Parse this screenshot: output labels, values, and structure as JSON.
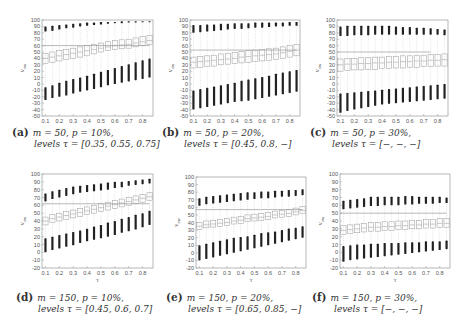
{
  "figure": {
    "panels": [
      {
        "id": "a",
        "tag": "(a)",
        "line1": "m = 50, p = 10%,",
        "line2": "levels τ = [0.35, 0.55, 0.75]"
      },
      {
        "id": "b",
        "tag": "(b)",
        "line1": "m = 50, p = 20%,",
        "line2": "levels τ = [0.45, 0.8, −]"
      },
      {
        "id": "c",
        "tag": "(c)",
        "line1": "m = 50, p = 30%,",
        "line2": "levels τ = [−, −, −]"
      },
      {
        "id": "d",
        "tag": "(d)",
        "line1": "m = 150, p = 10%,",
        "line2": "levels τ = [0.45, 0.6, 0.7]"
      },
      {
        "id": "e",
        "tag": "(e)",
        "line1": "m = 150, p = 20%,",
        "line2": "levels τ = [0.65, 0.85, −]"
      },
      {
        "id": "f",
        "tag": "(f)",
        "line1": "m = 150, p = 30%,",
        "line2": "levels τ = [−, −, −]"
      }
    ]
  },
  "chart_data": [
    {
      "type": "box",
      "panel": "a",
      "title": "(a) m = 50, p = 10%, levels τ = [0.35, 0.55, 0.75]",
      "xlabel": "τ",
      "ylabel": "v_sw",
      "ylim": [
        -50,
        100
      ],
      "yticks": [
        -50,
        -40,
        -30,
        -20,
        -10,
        0,
        10,
        20,
        30,
        40,
        50,
        60,
        70,
        80,
        90,
        100
      ],
      "xticks": [
        0.1,
        0.2,
        0.3,
        0.4,
        0.5,
        0.6,
        0.7,
        0.8
      ],
      "x": [
        0.1,
        0.15,
        0.2,
        0.25,
        0.3,
        0.35,
        0.4,
        0.45,
        0.5,
        0.55,
        0.6,
        0.65,
        0.7,
        0.75,
        0.8,
        0.85
      ],
      "reference_line": {
        "y": 60,
        "x_end": 0.85
      },
      "median": [
        40,
        42,
        44,
        46,
        48,
        50,
        52,
        54,
        56,
        58,
        60,
        61,
        62,
        64,
        66,
        68
      ],
      "q1": [
        32,
        34,
        36,
        38,
        40,
        42,
        44,
        47,
        50,
        52,
        54,
        55,
        56,
        58,
        60,
        62
      ],
      "q3": [
        48,
        50,
        52,
        54,
        56,
        58,
        60,
        62,
        64,
        66,
        68,
        69,
        70,
        72,
        74,
        76
      ],
      "upper_cluster": [
        [
          82,
          90
        ],
        [
          83,
          91
        ],
        [
          85,
          92
        ],
        [
          87,
          93
        ],
        [
          88,
          94
        ],
        [
          90,
          95
        ],
        [
          91,
          96
        ],
        [
          92,
          96
        ],
        [
          93,
          97
        ],
        [
          94,
          97
        ],
        [
          95,
          97
        ],
        [
          95,
          98
        ],
        [
          96,
          98
        ],
        [
          96,
          98
        ],
        [
          97,
          98
        ],
        [
          97,
          98
        ]
      ],
      "lower_cluster": [
        [
          -25,
          -5
        ],
        [
          -22,
          -2
        ],
        [
          -20,
          2
        ],
        [
          -18,
          5
        ],
        [
          -15,
          8
        ],
        [
          -12,
          10
        ],
        [
          -10,
          13
        ],
        [
          -8,
          16
        ],
        [
          -5,
          19
        ],
        [
          -2,
          22
        ],
        [
          0,
          25
        ],
        [
          2,
          28
        ],
        [
          4,
          31
        ],
        [
          6,
          34
        ],
        [
          8,
          37
        ],
        [
          10,
          40
        ]
      ]
    },
    {
      "type": "box",
      "panel": "b",
      "title": "(b) m = 50, p = 20%, levels τ = [0.45, 0.8, −]",
      "xlabel": "τ",
      "ylabel": "v_sw",
      "ylim": [
        -50,
        100
      ],
      "yticks": [
        -50,
        -40,
        -30,
        -20,
        -10,
        0,
        10,
        20,
        30,
        40,
        50,
        60,
        70,
        80,
        90,
        100
      ],
      "xticks": [
        0.1,
        0.2,
        0.3,
        0.4,
        0.5,
        0.6,
        0.7,
        0.8
      ],
      "x": [
        0.1,
        0.15,
        0.2,
        0.25,
        0.3,
        0.35,
        0.4,
        0.45,
        0.5,
        0.55,
        0.6,
        0.65,
        0.7,
        0.75,
        0.8,
        0.85
      ],
      "reference_line": {
        "y": 53,
        "x_end": 0.85
      },
      "median": [
        34,
        35,
        36,
        37,
        38,
        39,
        40,
        42,
        43,
        44,
        45,
        46,
        47,
        49,
        51,
        53
      ],
      "q1": [
        25,
        26,
        27,
        28,
        30,
        31,
        32,
        33,
        34,
        35,
        36,
        37,
        38,
        40,
        42,
        44
      ],
      "q3": [
        42,
        43,
        44,
        45,
        47,
        48,
        49,
        51,
        52,
        53,
        54,
        55,
        56,
        58,
        60,
        62
      ],
      "upper_cluster": [
        [
          80,
          92
        ],
        [
          81,
          92
        ],
        [
          82,
          93
        ],
        [
          83,
          93
        ],
        [
          84,
          94
        ],
        [
          85,
          94
        ],
        [
          86,
          95
        ],
        [
          86,
          95
        ],
        [
          87,
          95
        ],
        [
          88,
          96
        ],
        [
          88,
          96
        ],
        [
          89,
          96
        ],
        [
          90,
          96
        ],
        [
          90,
          96
        ],
        [
          91,
          97
        ],
        [
          91,
          97
        ]
      ],
      "lower_cluster": [
        [
          -40,
          -10
        ],
        [
          -38,
          -8
        ],
        [
          -36,
          -6
        ],
        [
          -34,
          -4
        ],
        [
          -32,
          -2
        ],
        [
          -30,
          0
        ],
        [
          -28,
          2
        ],
        [
          -27,
          5
        ],
        [
          -26,
          7
        ],
        [
          -24,
          9
        ],
        [
          -22,
          11
        ],
        [
          -20,
          13
        ],
        [
          -18,
          16
        ],
        [
          -16,
          18
        ],
        [
          -14,
          20
        ],
        [
          -12,
          22
        ]
      ]
    },
    {
      "type": "box",
      "panel": "c",
      "title": "(c) m = 50, p = 30%, levels τ = [−, −, −]",
      "xlabel": "τ",
      "ylabel": "v_sw",
      "ylim": [
        -50,
        100
      ],
      "yticks": [
        -50,
        -40,
        -30,
        -20,
        -10,
        0,
        10,
        20,
        30,
        40,
        50,
        60,
        70,
        80,
        90,
        100
      ],
      "xticks": [
        0.1,
        0.2,
        0.3,
        0.4,
        0.5,
        0.6,
        0.7,
        0.8
      ],
      "x": [
        0.1,
        0.15,
        0.2,
        0.25,
        0.3,
        0.35,
        0.4,
        0.45,
        0.5,
        0.55,
        0.6,
        0.65,
        0.7,
        0.75,
        0.8,
        0.85
      ],
      "reference_line": {
        "y": 50,
        "x_end": 0.75
      },
      "median": [
        30,
        31,
        31,
        32,
        32,
        33,
        33,
        34,
        34,
        35,
        35,
        36,
        36,
        37,
        37,
        38
      ],
      "q1": [
        20,
        21,
        22,
        22,
        23,
        23,
        24,
        24,
        25,
        25,
        26,
        26,
        27,
        27,
        28,
        28
      ],
      "q3": [
        39,
        40,
        40,
        41,
        41,
        42,
        42,
        43,
        43,
        44,
        44,
        45,
        45,
        46,
        46,
        47
      ],
      "upper_cluster": [
        [
          75,
          90
        ],
        [
          75,
          91
        ],
        [
          76,
          91
        ],
        [
          76,
          91
        ],
        [
          76,
          91
        ],
        [
          77,
          91
        ],
        [
          77,
          91
        ],
        [
          77,
          91
        ],
        [
          77,
          90
        ],
        [
          77,
          89
        ],
        [
          77,
          89
        ],
        [
          77,
          88
        ],
        [
          77,
          88
        ],
        [
          77,
          87
        ],
        [
          77,
          86
        ],
        [
          76,
          85
        ]
      ],
      "lower_cluster": [
        [
          -45,
          -15
        ],
        [
          -42,
          -14
        ],
        [
          -40,
          -13
        ],
        [
          -38,
          -12
        ],
        [
          -36,
          -11
        ],
        [
          -34,
          -10
        ],
        [
          -32,
          -9
        ],
        [
          -31,
          -8
        ],
        [
          -30,
          -7
        ],
        [
          -29,
          -6
        ],
        [
          -28,
          -5
        ],
        [
          -27,
          -4
        ],
        [
          -26,
          -3
        ],
        [
          -25,
          -2
        ],
        [
          -24,
          -1
        ],
        [
          -23,
          0
        ]
      ]
    },
    {
      "type": "box",
      "panel": "d",
      "title": "(d) m = 150, p = 10%, levels τ = [0.45, 0.6, 0.7]",
      "xlabel": "τ",
      "ylabel": "v_sw",
      "ylim": [
        -20,
        100
      ],
      "yticks": [
        -20,
        -10,
        0,
        10,
        20,
        30,
        40,
        50,
        60,
        70,
        80,
        90,
        100
      ],
      "xticks": [
        0.1,
        0.2,
        0.3,
        0.4,
        0.5,
        0.6,
        0.7,
        0.8
      ],
      "x": [
        0.1,
        0.15,
        0.2,
        0.25,
        0.3,
        0.35,
        0.4,
        0.45,
        0.5,
        0.55,
        0.6,
        0.65,
        0.7,
        0.75,
        0.8,
        0.85
      ],
      "reference_line": {
        "y": 62,
        "x_end": 0.85
      },
      "median": [
        40,
        43,
        45,
        47,
        49,
        51,
        53,
        55,
        57,
        59,
        61,
        63,
        65,
        67,
        69,
        71
      ],
      "q1": [
        35,
        38,
        40,
        42,
        44,
        46,
        48,
        50,
        52,
        54,
        56,
        58,
        60,
        62,
        64,
        66
      ],
      "q3": [
        45,
        48,
        50,
        52,
        54,
        56,
        58,
        60,
        62,
        64,
        66,
        68,
        70,
        72,
        74,
        76
      ],
      "upper_cluster": [
        [
          65,
          75
        ],
        [
          68,
          78
        ],
        [
          70,
          80
        ],
        [
          72,
          82
        ],
        [
          74,
          84
        ],
        [
          76,
          85
        ],
        [
          77,
          86
        ],
        [
          78,
          87
        ],
        [
          79,
          88
        ],
        [
          80,
          89
        ],
        [
          82,
          90
        ],
        [
          83,
          90
        ],
        [
          85,
          91
        ],
        [
          86,
          92
        ],
        [
          87,
          93
        ],
        [
          88,
          94
        ]
      ],
      "lower_cluster": [
        [
          0,
          18
        ],
        [
          3,
          20
        ],
        [
          5,
          22
        ],
        [
          7,
          24
        ],
        [
          9,
          26
        ],
        [
          12,
          28
        ],
        [
          14,
          30
        ],
        [
          16,
          33
        ],
        [
          18,
          35
        ],
        [
          20,
          38
        ],
        [
          22,
          40
        ],
        [
          25,
          43
        ],
        [
          27,
          45
        ],
        [
          29,
          48
        ],
        [
          32,
          50
        ],
        [
          35,
          53
        ]
      ]
    },
    {
      "type": "box",
      "panel": "e",
      "title": "(e) m = 150, p = 20%, levels τ = [0.65, 0.85, −]",
      "xlabel": "τ",
      "ylabel": "v_sw",
      "ylim": [
        -20,
        100
      ],
      "yticks": [
        -20,
        -10,
        0,
        10,
        20,
        30,
        40,
        50,
        60,
        70,
        80,
        90,
        100
      ],
      "xticks": [
        0.1,
        0.2,
        0.3,
        0.4,
        0.5,
        0.6,
        0.7,
        0.8
      ],
      "x": [
        0.1,
        0.15,
        0.2,
        0.25,
        0.3,
        0.35,
        0.4,
        0.45,
        0.5,
        0.55,
        0.6,
        0.65,
        0.7,
        0.75,
        0.8,
        0.85
      ],
      "reference_line": {
        "y": 57,
        "x_end": 0.85
      },
      "median": [
        35,
        37,
        38,
        39,
        40,
        42,
        43,
        45,
        46,
        47,
        48,
        50,
        51,
        52,
        54,
        56
      ],
      "q1": [
        31,
        33,
        34,
        35,
        36,
        38,
        39,
        41,
        42,
        43,
        44,
        46,
        47,
        48,
        50,
        52
      ],
      "q3": [
        40,
        42,
        43,
        44,
        45,
        47,
        48,
        50,
        51,
        52,
        53,
        55,
        56,
        57,
        59,
        61
      ],
      "upper_cluster": [
        [
          62,
          72
        ],
        [
          64,
          74
        ],
        [
          65,
          75
        ],
        [
          66,
          76
        ],
        [
          67,
          77
        ],
        [
          68,
          78
        ],
        [
          69,
          79
        ],
        [
          70,
          80
        ],
        [
          71,
          80
        ],
        [
          72,
          81
        ],
        [
          72,
          81
        ],
        [
          73,
          82
        ],
        [
          74,
          82
        ],
        [
          74,
          83
        ],
        [
          75,
          83
        ],
        [
          76,
          84
        ]
      ],
      "lower_cluster": [
        [
          -10,
          10
        ],
        [
          -8,
          12
        ],
        [
          -6,
          14
        ],
        [
          -4,
          16
        ],
        [
          -2,
          18
        ],
        [
          0,
          20
        ],
        [
          2,
          21
        ],
        [
          4,
          22
        ],
        [
          6,
          24
        ],
        [
          8,
          26
        ],
        [
          10,
          27
        ],
        [
          12,
          28
        ],
        [
          14,
          30
        ],
        [
          16,
          32
        ],
        [
          18,
          33
        ],
        [
          20,
          35
        ]
      ]
    },
    {
      "type": "box",
      "panel": "f",
      "title": "(f) m = 150, p = 30%, levels τ = [−, −, −]",
      "xlabel": "τ",
      "ylabel": "v_sw",
      "ylim": [
        -20,
        100
      ],
      "yticks": [
        -20,
        -10,
        0,
        10,
        20,
        30,
        40,
        50,
        60,
        70,
        80,
        90,
        100
      ],
      "xticks": [
        0.1,
        0.2,
        0.3,
        0.4,
        0.5,
        0.6,
        0.7,
        0.8
      ],
      "x": [
        0.1,
        0.15,
        0.2,
        0.25,
        0.3,
        0.35,
        0.4,
        0.45,
        0.5,
        0.55,
        0.6,
        0.65,
        0.7,
        0.75,
        0.8,
        0.85
      ],
      "reference_line": {
        "y": 50,
        "x_end": 0.85
      },
      "median": [
        28,
        29,
        30,
        31,
        32,
        32,
        33,
        33,
        34,
        34,
        35,
        35,
        36,
        36,
        37,
        37
      ],
      "q1": [
        23,
        24,
        25,
        26,
        27,
        27,
        28,
        28,
        29,
        29,
        30,
        30,
        31,
        31,
        32,
        32
      ],
      "q3": [
        34,
        35,
        36,
        37,
        38,
        38,
        39,
        39,
        40,
        40,
        41,
        41,
        42,
        42,
        43,
        43
      ],
      "upper_cluster": [
        [
          55,
          66
        ],
        [
          56,
          67
        ],
        [
          57,
          68
        ],
        [
          58,
          69
        ],
        [
          59,
          71
        ],
        [
          59,
          71
        ],
        [
          60,
          71
        ],
        [
          60,
          71
        ],
        [
          60,
          71
        ],
        [
          61,
          72
        ],
        [
          61,
          72
        ],
        [
          62,
          71
        ],
        [
          62,
          71
        ],
        [
          62,
          71
        ],
        [
          63,
          71
        ],
        [
          63,
          70
        ]
      ],
      "lower_cluster": [
        [
          -12,
          8
        ],
        [
          -10,
          9
        ],
        [
          -9,
          10
        ],
        [
          -8,
          10
        ],
        [
          -7,
          11
        ],
        [
          -6,
          11
        ],
        [
          -5,
          12
        ],
        [
          -4,
          12
        ],
        [
          -3,
          12
        ],
        [
          -2,
          13
        ],
        [
          -1,
          13
        ],
        [
          0,
          13
        ],
        [
          1,
          14
        ],
        [
          2,
          14
        ],
        [
          3,
          14
        ],
        [
          4,
          15
        ]
      ]
    }
  ]
}
